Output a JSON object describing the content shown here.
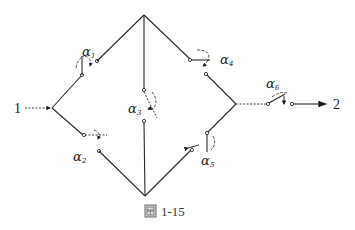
{
  "figure": {
    "caption_icon": "figure-glyph-icon",
    "caption": "1-15",
    "input_node_label": "1",
    "output_node_label": "2"
  },
  "switches": [
    {
      "id": "s1",
      "label": "α",
      "subscript": "1",
      "branch": "left-vertex to top-vertex"
    },
    {
      "id": "s2",
      "label": "α",
      "subscript": "2",
      "branch": "left-vertex to bottom-vertex"
    },
    {
      "id": "s3",
      "label": "α",
      "subscript": "3",
      "branch": "top-vertex to bottom-vertex (bridge)"
    },
    {
      "id": "s4",
      "label": "α",
      "subscript": "4",
      "branch": "top-vertex to right-vertex"
    },
    {
      "id": "s5",
      "label": "α",
      "subscript": "5",
      "branch": "bottom-vertex to right-vertex"
    },
    {
      "id": "s6",
      "label": "α",
      "subscript": "6",
      "branch": "right-vertex to output (series)"
    }
  ],
  "colors": {
    "line": "#2a2a2a",
    "background": "#ffffff"
  }
}
